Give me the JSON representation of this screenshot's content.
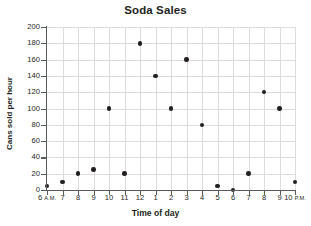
{
  "chart_data": {
    "type": "scatter",
    "title": "Soda Sales",
    "xlabel": "Time of day",
    "ylabel": "Cans sold per hour",
    "grid": true,
    "legend": "none",
    "ylim": [
      0,
      200
    ],
    "yticks": [
      0,
      20,
      40,
      60,
      80,
      100,
      120,
      140,
      160,
      180,
      200
    ],
    "ytick_labels": [
      "0",
      "20",
      "40",
      "60",
      "80",
      "100",
      "120",
      "140",
      "160",
      "180",
      "200"
    ],
    "categories": [
      "6 A.M.",
      "7",
      "8",
      "9",
      "10",
      "11",
      "12",
      "1",
      "2",
      "3",
      "4",
      "5",
      "6",
      "7",
      "8",
      "9",
      "10 P.M."
    ],
    "xtick_labels": [
      {
        "num": "6",
        "ampm": "A.M."
      },
      {
        "num": "7",
        "ampm": ""
      },
      {
        "num": "8",
        "ampm": ""
      },
      {
        "num": "9",
        "ampm": ""
      },
      {
        "num": "10",
        "ampm": ""
      },
      {
        "num": "11",
        "ampm": ""
      },
      {
        "num": "12",
        "ampm": ""
      },
      {
        "num": "1",
        "ampm": ""
      },
      {
        "num": "2",
        "ampm": ""
      },
      {
        "num": "3",
        "ampm": ""
      },
      {
        "num": "4",
        "ampm": ""
      },
      {
        "num": "5",
        "ampm": ""
      },
      {
        "num": "6",
        "ampm": ""
      },
      {
        "num": "7",
        "ampm": ""
      },
      {
        "num": "8",
        "ampm": ""
      },
      {
        "num": "9",
        "ampm": ""
      },
      {
        "num": "10",
        "ampm": "P.M."
      }
    ],
    "values": [
      5,
      10,
      20,
      25,
      100,
      20,
      180,
      140,
      100,
      160,
      80,
      5,
      0,
      20,
      120,
      100,
      10
    ],
    "points": [
      {
        "x": "6 A.M.",
        "y": 5
      },
      {
        "x": "7",
        "y": 10
      },
      {
        "x": "8",
        "y": 20
      },
      {
        "x": "9",
        "y": 25
      },
      {
        "x": "10",
        "y": 100
      },
      {
        "x": "11",
        "y": 20
      },
      {
        "x": "12",
        "y": 180
      },
      {
        "x": "1",
        "y": 140
      },
      {
        "x": "2",
        "y": 100
      },
      {
        "x": "3",
        "y": 160
      },
      {
        "x": "4",
        "y": 80
      },
      {
        "x": "5",
        "y": 5
      },
      {
        "x": "6",
        "y": 0
      },
      {
        "x": "7",
        "y": 20
      },
      {
        "x": "8",
        "y": 120
      },
      {
        "x": "9",
        "y": 100
      },
      {
        "x": "10 P.M.",
        "y": 10
      }
    ],
    "marker_color": "#231f20",
    "grid_color": "#dcdcdc",
    "axis_color": "#58595b"
  }
}
